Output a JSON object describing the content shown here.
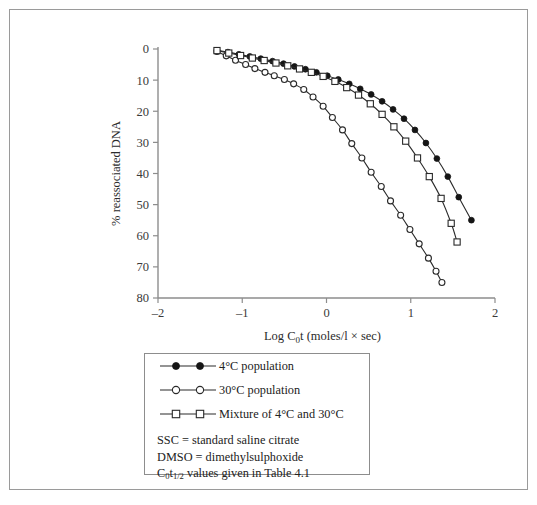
{
  "figure": {
    "y_axis_title": "% reassociated DNA",
    "x_axis_title_main_a": "Log C",
    "x_axis_title_sub": "0",
    "x_axis_title_main_b": "t (moles/l × sec)",
    "x_tick_labels": [
      "–2",
      "–1",
      "0",
      "1",
      "2"
    ],
    "y_tick_labels": [
      "0",
      "10",
      "20",
      "30",
      "40",
      "50",
      "60",
      "70",
      "80"
    ]
  },
  "legend": {
    "items": [
      {
        "label": "4°C population",
        "marker": "filled-circle"
      },
      {
        "label": "30°C population",
        "marker": "open-circle"
      },
      {
        "label": "Mixture of 4°C and 30°C",
        "marker": "open-square"
      }
    ],
    "notes": [
      {
        "text": "SSC = standard saline citrate"
      },
      {
        "text": "DMSO = dimethylsulphoxide"
      }
    ],
    "note_cot": {
      "prefix": "C",
      "sub_zero": "0",
      "t": "t",
      "half": "1/2",
      "suffix": " values given in Table 4.1"
    }
  },
  "colors": {
    "axis": "#8d8d8d",
    "curve": "#2a2a2a",
    "marker_fill": "#151515",
    "marker_open": "#ffffff",
    "frame": "#9a9a9a",
    "text": "#222222"
  },
  "chart_data": {
    "type": "line",
    "title": "",
    "xlabel": "Log C0t (moles/l × sec)",
    "ylabel": "% reassociated DNA",
    "xlim": [
      -2,
      2
    ],
    "ylim": [
      0,
      80
    ],
    "y_axis_inverted": true,
    "xticks": [
      -2,
      -1,
      0,
      1,
      2
    ],
    "yticks": [
      0,
      10,
      20,
      30,
      40,
      50,
      60,
      70,
      80
    ],
    "grid": false,
    "legend_position": "below-plot",
    "series": [
      {
        "name": "4°C population",
        "marker": "filled-circle",
        "x": [
          -1.3,
          -1.17,
          -1.04,
          -0.91,
          -0.78,
          -0.64,
          -0.51,
          -0.38,
          -0.25,
          -0.12,
          0.01,
          0.14,
          0.27,
          0.4,
          0.53,
          0.66,
          0.79,
          0.92,
          1.05,
          1.18,
          1.31,
          1.44,
          1.57,
          1.72
        ],
        "y": [
          0.4,
          1.0,
          1.7,
          2.4,
          3.1,
          3.9,
          4.7,
          5.6,
          6.5,
          7.5,
          8.6,
          9.8,
          11.2,
          12.8,
          14.6,
          16.8,
          19.4,
          22.4,
          26.0,
          30.2,
          35.2,
          41.0,
          47.6,
          55.0
        ]
      },
      {
        "name": "30°C population",
        "marker": "open-circle",
        "x": [
          -1.3,
          -1.19,
          -1.08,
          -0.96,
          -0.85,
          -0.73,
          -0.62,
          -0.5,
          -0.39,
          -0.27,
          -0.16,
          -0.04,
          0.07,
          0.19,
          0.3,
          0.42,
          0.53,
          0.65,
          0.76,
          0.88,
          0.99,
          1.1,
          1.21,
          1.3,
          1.37
        ],
        "y": [
          0.8,
          2.2,
          3.6,
          5.0,
          6.3,
          7.5,
          8.6,
          9.8,
          11.2,
          13.0,
          15.4,
          18.4,
          22.0,
          26.0,
          30.4,
          35.0,
          39.6,
          44.2,
          48.8,
          53.4,
          58.0,
          62.6,
          67.2,
          71.4,
          75.0
        ]
      },
      {
        "name": "Mixture of 4°C and 30°C",
        "marker": "open-square",
        "x": [
          -1.3,
          -1.16,
          -1.02,
          -0.88,
          -0.74,
          -0.6,
          -0.46,
          -0.32,
          -0.18,
          -0.04,
          0.1,
          0.24,
          0.38,
          0.52,
          0.66,
          0.8,
          0.94,
          1.08,
          1.22,
          1.36,
          1.48,
          1.55
        ],
        "y": [
          0.5,
          1.3,
          2.1,
          2.9,
          3.7,
          4.5,
          5.4,
          6.4,
          7.5,
          8.8,
          10.4,
          12.4,
          14.8,
          17.6,
          21.0,
          25.0,
          29.6,
          35.0,
          41.0,
          48.0,
          56.0,
          62.0
        ]
      }
    ]
  }
}
